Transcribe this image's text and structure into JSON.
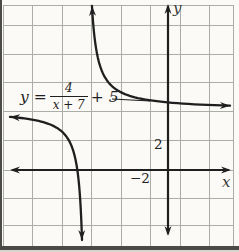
{
  "figure": {
    "bg_color": "#fbfaf6",
    "grid_color": "#abaea8",
    "axis_color": "#1f1f1f",
    "curve_color": "#1f1f1f",
    "frame_color": "#4a4a48",
    "equation": {
      "lhs": "y =",
      "numerator": "4",
      "denominator": "x + 7",
      "rhs": "+ 5"
    },
    "labels": {
      "x_axis": "x",
      "y_axis": "y",
      "y_tick": "2",
      "x_tick": "−2"
    }
  },
  "chart_data": {
    "type": "line",
    "function": {
      "form": "y = a/(x − h) + k",
      "a": 4,
      "h": -7,
      "k": 5,
      "equation_text": "y = 4/(x + 7) + 5"
    },
    "vertical_asymptote_x": -7,
    "horizontal_asymptote_y": 5,
    "x_intercept": -7.8,
    "axes": {
      "xlabel": "x",
      "ylabel": "y",
      "x_tick_labels": [
        "-2"
      ],
      "y_tick_labels": [
        "2"
      ],
      "units_per_grid_square": 2,
      "grid": true
    },
    "branches": [
      {
        "name": "upper-right",
        "domain": "x > -7",
        "behavior": "falls from +infinity, flattens toward y = 5, arrows up and right"
      },
      {
        "name": "lower-left",
        "domain": "x < -7",
        "behavior": "comes from y = 5 at far left, plunges to -infinity, arrows left and down"
      }
    ],
    "pixel_map": {
      "origin": {
        "x": 168,
        "y": 170
      },
      "asymptote_px": {
        "x": 86,
        "y": 110
      },
      "grid_x": [
        3,
        32,
        62,
        91,
        121,
        150,
        180,
        209,
        233
      ],
      "grid_y": [
        5,
        25,
        54,
        82,
        111,
        140,
        170,
        198,
        225
      ],
      "grid_left": 3,
      "grid_right": 233,
      "grid_top": 5,
      "grid_bottom": 249,
      "x_axis": {
        "y": 170,
        "x1": 10,
        "x2": 231
      },
      "y_axis": {
        "x": 168,
        "y1": 4,
        "y2": 236
      },
      "upper_branch": {
        "c": 620,
        "px_end": 230,
        "py_top": 6
      },
      "lower_branch": {
        "c": 520,
        "px_start": 10,
        "py_bottom": 240
      },
      "leader_line": {
        "x1": 112,
        "y1": 99,
        "x2": 150,
        "y2": 101
      }
    }
  }
}
